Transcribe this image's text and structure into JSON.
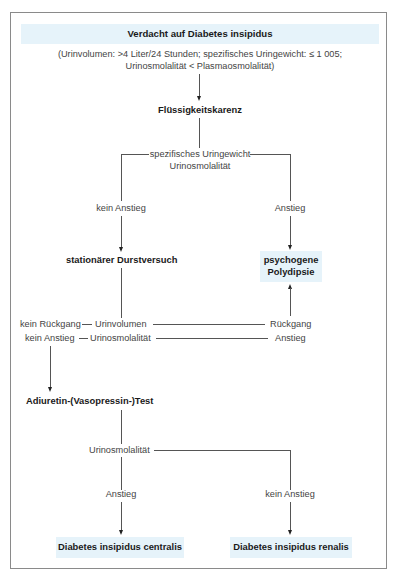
{
  "title": "Verdacht auf Diabetes insipidus",
  "criteria": {
    "line1": "(Urinvolumen: >4 Liter/24 Stunden; spezifisches Uringewicht: ≤ 1 005;",
    "line2": "Urinosmolalität < Plasmaosmolalität)"
  },
  "steps": {
    "fluessigkeitskarenz": "Flüssigkeitskarenz",
    "criteria_step1": {
      "line1": "spezifisches Uringewicht",
      "line2": "Urinosmolalität"
    },
    "branch_left_label": "kein Anstieg",
    "branch_right_label": "Anstieg",
    "durstversuch": "stationärer Durstversuch",
    "psychogene": {
      "line1": "psychogene",
      "line2": "Polydipsie"
    },
    "row1": {
      "left": "kein Rückgang",
      "middle": "Urinvolumen",
      "right": "Rückgang"
    },
    "row2": {
      "left": "kein Anstieg",
      "middle": "Urinosmolalität",
      "right": "Anstieg"
    },
    "adiuretin_test": "Adiuretin-(Vasopressin-)Test",
    "urinosmolalitaet": "Urinosmolalität",
    "final_left_label": "Anstieg",
    "final_right_label": "kein Anstieg"
  },
  "results": {
    "centralis": "Diabetes insipidus centralis",
    "renalis": "Diabetes insipidus renalis"
  },
  "colors": {
    "highlight_band": "#e6f3fa",
    "frame_border": "#8a8a8a",
    "connector": "#555555"
  }
}
